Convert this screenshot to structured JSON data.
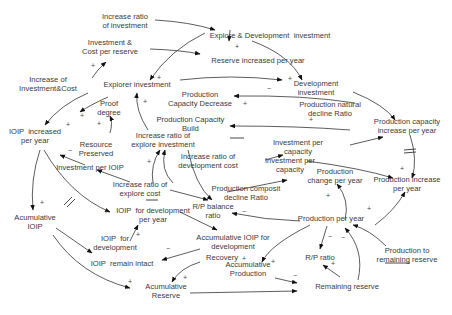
{
  "diagram": {
    "type": "causal-loop",
    "nodes": [
      {
        "id": "n1",
        "label": "Increase ratio\nof investment",
        "x": 125,
        "y": 22
      },
      {
        "id": "n2",
        "label": "Explore & Development  investment",
        "x": 270,
        "y": 36
      },
      {
        "id": "n3",
        "label": "Investment &\nCost per reserve",
        "x": 110,
        "y": 48
      },
      {
        "id": "n4",
        "label": "Reserve increased per year",
        "x": 258,
        "y": 61
      },
      {
        "id": "n5",
        "label": "Development\ninvestment",
        "x": 316,
        "y": 89
      },
      {
        "id": "n6",
        "label": "Increase of\nInvestment&Cost",
        "x": 48,
        "y": 85
      },
      {
        "id": "n7",
        "label": "Explorer investment",
        "x": 137,
        "y": 85
      },
      {
        "id": "n8",
        "label": "Production\nCapacity Decrease",
        "x": 200,
        "y": 100
      },
      {
        "id": "n9",
        "label": "Production natural\ndecline Ratio",
        "x": 330,
        "y": 110
      },
      {
        "id": "n10",
        "label": "Proof\ndegree",
        "x": 109,
        "y": 109
      },
      {
        "id": "n11",
        "label": "Production Capacity\nBuild",
        "x": 94,
        "y": 125,
        "offsetX": 150
      },
      {
        "id": "n12",
        "label": "Production capacity\nincrease per year",
        "x": 407,
        "y": 127
      },
      {
        "id": "n13",
        "label": "IOIP  increased\nper year",
        "x": 35,
        "y": 137
      },
      {
        "id": "n14",
        "label": "Increase ratio of\nexplore investment",
        "x": 163,
        "y": 141
      },
      {
        "id": "n15",
        "label": "Resource\nPreserved",
        "x": 96,
        "y": 150
      },
      {
        "id": "n16",
        "label": "Increase ratio of\ndevelopment cost",
        "x": 208,
        "y": 162
      },
      {
        "id": "n17",
        "label": "Investment per\ncapacity",
        "x": 298,
        "y": 148
      },
      {
        "id": "n18",
        "label": "Investment per\ncapacity",
        "x": 290,
        "y": 166
      },
      {
        "id": "n19",
        "label": "Investment per IOIP",
        "x": 90,
        "y": 168
      },
      {
        "id": "n20",
        "label": "Production\nchange per year",
        "x": 335,
        "y": 177
      },
      {
        "id": "n21",
        "label": "Production increase\nper year",
        "x": 407,
        "y": 185
      },
      {
        "id": "n22",
        "label": "Production composit\ndecline Ratio",
        "x": 246,
        "y": 194
      },
      {
        "id": "n23",
        "label": "Increase ratio of\nexplore cost",
        "x": 140,
        "y": 190
      },
      {
        "id": "n24",
        "label": "R/P balance\nratio",
        "x": 213,
        "y": 212
      },
      {
        "id": "n25",
        "label": "Production per year",
        "x": 331,
        "y": 219
      },
      {
        "id": "n26",
        "label": "Acumulative\nIOIP",
        "x": 35,
        "y": 223
      },
      {
        "id": "n27",
        "label": "IOIP  for development\nper year",
        "x": 153,
        "y": 216
      },
      {
        "id": "n28",
        "label": "IOIP  for\ndevelopment",
        "x": 115,
        "y": 244
      },
      {
        "id": "n29",
        "label": "Accumulative IOIP for\ndevelopment",
        "x": 233,
        "y": 243
      },
      {
        "id": "n30",
        "label": "R/P ratio",
        "x": 320,
        "y": 258
      },
      {
        "id": "n31",
        "label": "Production to\nremaining reserve",
        "x": 407,
        "y": 256
      },
      {
        "id": "n32",
        "label": "Recovery",
        "x": 222,
        "y": 258
      },
      {
        "id": "n33",
        "label": "Accumulative\nProduction",
        "x": 248,
        "y": 270
      },
      {
        "id": "n34",
        "label": "IOIP  remain intact",
        "x": 122,
        "y": 264
      },
      {
        "id": "n35",
        "label": "Remaining reserve",
        "x": 347,
        "y": 287
      },
      {
        "id": "n36",
        "label": "Acumulative\nReserve",
        "x": 166,
        "y": 292
      }
    ],
    "polarities": [
      {
        "s": "+",
        "x": 237,
        "y": 46
      },
      {
        "s": "+",
        "x": 159,
        "y": 77
      },
      {
        "s": "+",
        "x": 93,
        "y": 65
      },
      {
        "s": "+",
        "x": 145,
        "y": 101
      },
      {
        "s": "+",
        "x": 290,
        "y": 78
      },
      {
        "s": "−",
        "x": 269,
        "y": 88
      },
      {
        "s": "+",
        "x": 245,
        "y": 103
      },
      {
        "s": "+",
        "x": 82,
        "y": 115
      },
      {
        "s": "+",
        "x": 68,
        "y": 124
      },
      {
        "s": "+",
        "x": 99,
        "y": 123
      },
      {
        "s": "−",
        "x": 70,
        "y": 150
      },
      {
        "s": "+",
        "x": 149,
        "y": 161
      },
      {
        "s": "+",
        "x": 311,
        "y": 119
      },
      {
        "s": "+",
        "x": 402,
        "y": 168
      },
      {
        "s": "+",
        "x": 328,
        "y": 195
      },
      {
        "s": "+",
        "x": 369,
        "y": 208
      },
      {
        "s": "+",
        "x": 42,
        "y": 202
      },
      {
        "s": "+",
        "x": 106,
        "y": 211
      },
      {
        "s": "+",
        "x": 138,
        "y": 234
      },
      {
        "s": "−",
        "x": 168,
        "y": 248
      },
      {
        "s": "+",
        "x": 185,
        "y": 277
      },
      {
        "s": "+",
        "x": 130,
        "y": 281
      },
      {
        "s": "−",
        "x": 244,
        "y": 211
      },
      {
        "s": "−",
        "x": 330,
        "y": 236
      },
      {
        "s": "+",
        "x": 333,
        "y": 263
      },
      {
        "s": "+",
        "x": 273,
        "y": 261
      },
      {
        "s": "−",
        "x": 295,
        "y": 275
      },
      {
        "s": "−",
        "x": 343,
        "y": 237
      },
      {
        "s": "+",
        "x": 244,
        "y": 258
      }
    ]
  }
}
